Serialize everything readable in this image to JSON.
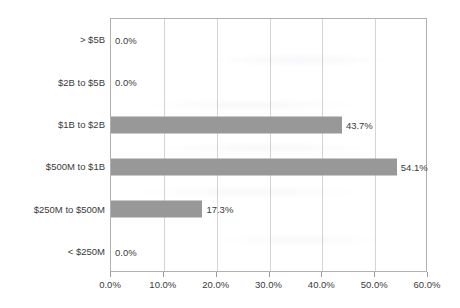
{
  "chart_data": {
    "type": "bar",
    "orientation": "horizontal",
    "title": "",
    "subtitle": "",
    "xlabel": "",
    "ylabel": "",
    "categories": [
      "> $5B",
      "$2B to $5B",
      "$1B to $2B",
      "$500M to $1B",
      "$250M to $500M",
      "< $250M"
    ],
    "values": [
      0.0,
      0.0,
      43.7,
      54.1,
      17.3,
      0.0
    ],
    "value_labels": [
      "0.0%",
      "0.0%",
      "43.7%",
      "54.1%",
      "17.3%",
      "0.0%"
    ],
    "xlim": [
      0,
      60
    ],
    "xticks": [
      0,
      10,
      20,
      30,
      40,
      50,
      60
    ],
    "xtick_labels": [
      "0.0%",
      "10.0%",
      "20.0%",
      "30.0%",
      "40.0%",
      "50.0%",
      "60.0%"
    ],
    "grid": "vertical",
    "legend": "none",
    "bar_color": "#989898",
    "frame_color": "#b0b0b0",
    "gridline_color": "#d4d4d4",
    "text_color": "#3a3a3a"
  }
}
